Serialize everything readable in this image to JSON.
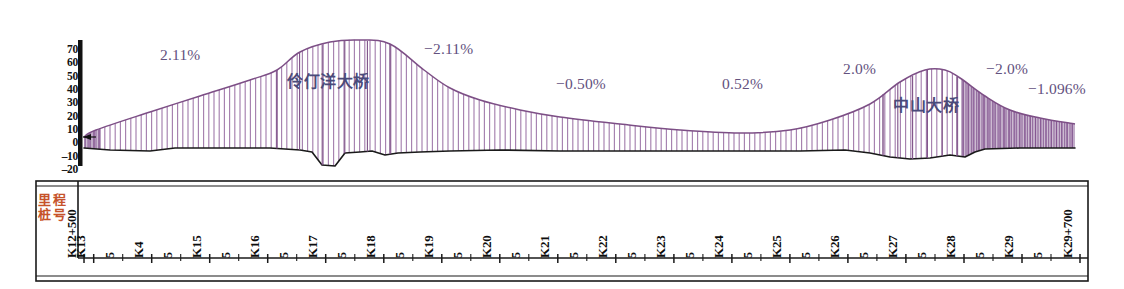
{
  "chart_data": {
    "type": "area",
    "title": "",
    "xlabel": "",
    "ylabel": "",
    "ylim": [
      -20,
      70
    ],
    "grid": false,
    "legend": "none",
    "y_ticks": [
      "70",
      "60",
      "50",
      "40",
      "30",
      "20",
      "10",
      "0",
      "-10",
      "-20"
    ],
    "y_tick_values": [
      70,
      60,
      50,
      40,
      30,
      20,
      10,
      0,
      -10,
      -20
    ],
    "gradients": [
      {
        "label": "2.11%",
        "value": 2.11,
        "x_px": 160,
        "y_px": 46
      },
      {
        "label": "-2.11%",
        "value": -2.11,
        "x_px": 424,
        "y_px": 40
      },
      {
        "label": "-0.50%",
        "value": -0.5,
        "x_px": 556,
        "y_px": 75
      },
      {
        "label": "0.52%",
        "value": 0.52,
        "x_px": 722,
        "y_px": 75
      },
      {
        "label": "2.0%",
        "value": 2.0,
        "x_px": 843,
        "y_px": 60
      },
      {
        "label": "-2.0%",
        "value": -2.0,
        "x_px": 986,
        "y_px": 60
      },
      {
        "label": "-1.096%",
        "value": -1.096,
        "x_px": 1028,
        "y_px": 80
      }
    ],
    "bridges": [
      {
        "name": "伶仃洋大桥",
        "x_px": 287,
        "y_px": 68,
        "start_px": 277,
        "end_px": 390
      },
      {
        "name": "中山大桥",
        "x_px": 893,
        "y_px": 92,
        "start_px": 883,
        "end_px": 957
      }
    ],
    "axis_caption_chars": [
      "里",
      "程",
      "桩",
      "号"
    ],
    "axis_caption": "里程桩号",
    "stations": [
      {
        "label": "K12+500",
        "type": "major",
        "x_px": 85
      },
      {
        "label": "K13",
        "type": "major",
        "x_px": 96
      },
      {
        "label": "5",
        "type": "minor",
        "x_px": 129
      },
      {
        "label": "K4",
        "type": "major",
        "x_px": 162
      },
      {
        "label": "5",
        "type": "minor",
        "x_px": 195
      },
      {
        "label": "K15",
        "type": "major",
        "x_px": 228
      },
      {
        "label": "5",
        "type": "minor",
        "x_px": 261
      },
      {
        "label": "K16",
        "type": "major",
        "x_px": 294
      },
      {
        "label": "5",
        "type": "minor",
        "x_px": 327
      },
      {
        "label": "K17",
        "type": "major",
        "x_px": 360
      },
      {
        "label": "5",
        "type": "minor",
        "x_px": 393
      },
      {
        "label": "K18",
        "type": "major",
        "x_px": 426
      },
      {
        "label": "5",
        "type": "minor",
        "x_px": 459
      },
      {
        "label": "K19",
        "type": "major",
        "x_px": 492
      },
      {
        "label": "5",
        "type": "minor",
        "x_px": 525
      },
      {
        "label": "K20",
        "type": "major",
        "x_px": 558
      },
      {
        "label": "5",
        "type": "minor",
        "x_px": 591
      },
      {
        "label": "K21",
        "type": "major",
        "x_px": 624
      },
      {
        "label": "5",
        "type": "minor",
        "x_px": 657
      },
      {
        "label": "K22",
        "type": "major",
        "x_px": 690
      },
      {
        "label": "5",
        "type": "minor",
        "x_px": 723
      },
      {
        "label": "K23",
        "type": "major",
        "x_px": 756
      },
      {
        "label": "5",
        "type": "minor",
        "x_px": 789
      },
      {
        "label": "K24",
        "type": "major",
        "x_px": 822
      },
      {
        "label": "5",
        "type": "minor",
        "x_px": 855
      },
      {
        "label": "K25",
        "type": "major",
        "x_px": 888
      },
      {
        "label": "5",
        "type": "minor",
        "x_px": 921
      },
      {
        "label": "K26",
        "type": "major",
        "x_px": 954
      },
      {
        "label": "5",
        "type": "minor",
        "x_px": 987
      },
      {
        "label": "K27",
        "type": "major",
        "x_px": 1020
      },
      {
        "label": "5",
        "type": "minor",
        "x_px": 1053
      },
      {
        "label": "K28",
        "type": "major",
        "x_px": 1086
      },
      {
        "label": "5",
        "type": "minor",
        "x_px": 1119
      },
      {
        "label": "K29",
        "type": "major",
        "x_px": 1152
      },
      {
        "label": "5",
        "type": "minor",
        "x_px": 1185
      },
      {
        "label": "K29+700",
        "type": "major",
        "x_px": 1218
      }
    ],
    "colors": {
      "profile_line": "#7d4f86",
      "hatch": "#a47fae",
      "ground_line": "#1a1a1a",
      "grade_text": "#63517e",
      "bridge_text": "#4a4a7a",
      "caption_text": "#c6522a",
      "axis": "#111111"
    },
    "design_grade_points": [
      [
        84,
        137
      ],
      [
        96,
        130
      ],
      [
        150,
        112
      ],
      [
        200,
        96
      ],
      [
        250,
        80
      ],
      [
        277,
        70
      ],
      [
        300,
        52
      ],
      [
        330,
        42
      ],
      [
        360,
        40
      ],
      [
        390,
        44
      ],
      [
        424,
        70
      ],
      [
        450,
        88
      ],
      [
        480,
        100
      ],
      [
        520,
        110
      ],
      [
        560,
        117
      ],
      [
        620,
        124
      ],
      [
        680,
        130
      ],
      [
        740,
        133
      ],
      [
        790,
        130
      ],
      [
        830,
        120
      ],
      [
        870,
        104
      ],
      [
        900,
        82
      ],
      [
        925,
        70
      ],
      [
        945,
        70
      ],
      [
        960,
        78
      ],
      [
        985,
        96
      ],
      [
        1010,
        110
      ],
      [
        1040,
        118
      ],
      [
        1075,
        124
      ]
    ],
    "ground_points": [
      [
        84,
        148
      ],
      [
        110,
        150
      ],
      [
        150,
        151
      ],
      [
        175,
        148
      ],
      [
        240,
        148
      ],
      [
        270,
        148
      ],
      [
        285,
        149
      ],
      [
        300,
        150
      ],
      [
        312,
        152
      ],
      [
        322,
        165
      ],
      [
        335,
        166
      ],
      [
        345,
        153
      ],
      [
        360,
        152
      ],
      [
        372,
        151
      ],
      [
        385,
        155
      ],
      [
        398,
        153
      ],
      [
        420,
        152
      ],
      [
        450,
        151
      ],
      [
        500,
        150
      ],
      [
        560,
        151
      ],
      [
        620,
        151
      ],
      [
        680,
        151
      ],
      [
        740,
        151
      ],
      [
        800,
        151
      ],
      [
        845,
        150
      ],
      [
        870,
        153
      ],
      [
        890,
        157
      ],
      [
        910,
        159
      ],
      [
        930,
        158
      ],
      [
        950,
        155
      ],
      [
        965,
        157
      ],
      [
        975,
        152
      ],
      [
        985,
        149
      ],
      [
        1020,
        148
      ],
      [
        1060,
        148
      ],
      [
        1075,
        148
      ]
    ]
  }
}
